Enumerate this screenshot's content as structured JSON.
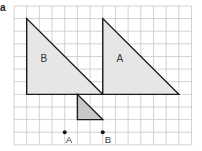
{
  "panel_label": "a",
  "grid": {
    "origin_x": 14,
    "origin_y": 6,
    "cell_w": 12.68,
    "cell_h": 12.62,
    "cols": 14,
    "rows": 11,
    "line_color": "#c8c8c8"
  },
  "shapes": [
    {
      "id": "triangle-b",
      "label": "B",
      "points": [
        [
          1,
          1
        ],
        [
          1,
          7
        ],
        [
          7,
          7
        ]
      ],
      "fill": "#e6e6e6",
      "stroke": "#1a1a1a",
      "label_pos": [
        2.35,
        4.4
      ]
    },
    {
      "id": "triangle-a",
      "label": "A",
      "points": [
        [
          7,
          1
        ],
        [
          7,
          7
        ],
        [
          13,
          7
        ]
      ],
      "fill": "#e6e6e6",
      "stroke": "#1a1a1a",
      "label_pos": [
        8.35,
        4.4
      ]
    },
    {
      "id": "small-triangle",
      "label": "",
      "points": [
        [
          5,
          7
        ],
        [
          5,
          9
        ],
        [
          7,
          9
        ]
      ],
      "fill": "#c8c8c8",
      "stroke": "#1a1a1a",
      "label_pos": null
    }
  ],
  "points": [
    {
      "label": "A",
      "at": [
        4,
        10
      ],
      "label_offset": [
        1,
        13
      ]
    },
    {
      "label": "B",
      "at": [
        7,
        10
      ],
      "label_offset": [
        2,
        13
      ]
    }
  ],
  "colors": {
    "outline": "#1a1a1a",
    "large_fill": "#e6e6e6",
    "small_fill": "#c8c8c8",
    "text": "#333333"
  }
}
